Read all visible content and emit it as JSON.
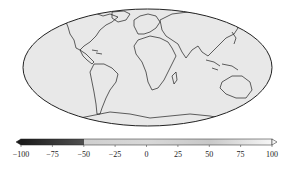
{
  "map": {
    "projection": "mollweide",
    "description": "Global field map in grayscale with coastlines",
    "background_color": "#e6e6e6",
    "coastline_color": "#1e1e1e"
  },
  "colorbar": {
    "orientation": "horizontal",
    "extend": "both",
    "vmin": -100,
    "vmax": 100,
    "ticks": [
      -100,
      -75,
      -50,
      -25,
      0,
      25,
      50,
      75,
      100
    ],
    "tick_labels": [
      "−100",
      "−75",
      "−50",
      "−25",
      "0",
      "25",
      "50",
      "75",
      "100"
    ],
    "colors": {
      "low": "#1a1a1a",
      "mid_low": "#707070",
      "mid": "#d8d8d8",
      "high": "#f4f4f4"
    }
  }
}
